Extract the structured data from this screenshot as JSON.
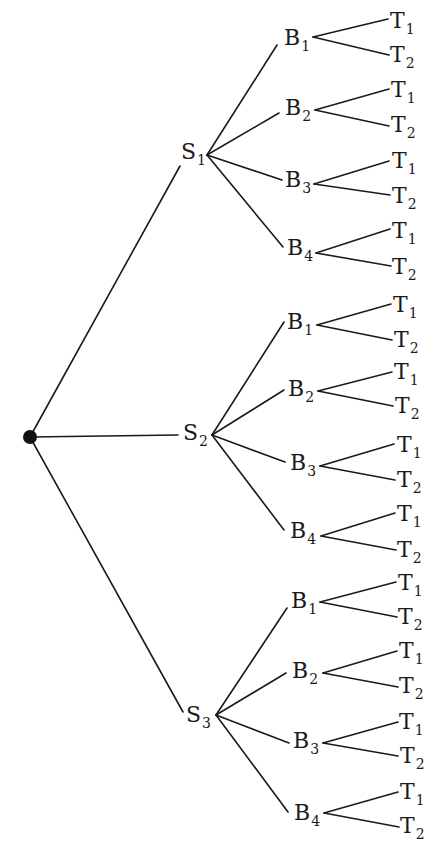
{
  "diagram": {
    "title": "",
    "type": "tree",
    "root": {
      "x": 30,
      "y": 437,
      "r": 7
    },
    "stage_nodes": [
      {
        "label": "S",
        "sub": "1",
        "label_pos": {
          "x": 181,
          "y": 141
        },
        "in_end": {
          "x": 180,
          "y": 166
        },
        "out_start": {
          "x": 207,
          "y": 155
        },
        "children": [
          {
            "label": "B",
            "sub": "1",
            "label_pos": {
              "x": 284,
              "y": 27
            },
            "in_end": {
              "x": 277,
              "y": 45
            },
            "out_start": {
              "x": 313,
              "y": 37
            },
            "leaves": [
              {
                "label": "T",
                "sub": "1",
                "label_pos": {
                  "x": 390,
                  "y": 10
                },
                "in_end": {
                  "x": 388,
                  "y": 19
                }
              },
              {
                "label": "T",
                "sub": "2",
                "label_pos": {
                  "x": 390,
                  "y": 44
                },
                "in_end": {
                  "x": 389,
                  "y": 55
                }
              }
            ]
          },
          {
            "label": "B",
            "sub": "2",
            "label_pos": {
              "x": 285,
              "y": 97
            },
            "in_end": {
              "x": 279,
              "y": 113
            },
            "out_start": {
              "x": 315,
              "y": 110
            },
            "leaves": [
              {
                "label": "T",
                "sub": "1",
                "label_pos": {
                  "x": 391,
                  "y": 79
                },
                "in_end": {
                  "x": 389,
                  "y": 89
                }
              },
              {
                "label": "T",
                "sub": "2",
                "label_pos": {
                  "x": 391,
                  "y": 114
                },
                "in_end": {
                  "x": 389,
                  "y": 126
                }
              }
            ]
          },
          {
            "label": "B",
            "sub": "3",
            "label_pos": {
              "x": 285,
              "y": 169
            },
            "in_end": {
              "x": 282,
              "y": 180
            },
            "out_start": {
              "x": 314,
              "y": 184
            },
            "leaves": [
              {
                "label": "T",
                "sub": "1",
                "label_pos": {
                  "x": 392,
                  "y": 150
                },
                "in_end": {
                  "x": 389,
                  "y": 161
                }
              },
              {
                "label": "T",
                "sub": "2",
                "label_pos": {
                  "x": 392,
                  "y": 185
                },
                "in_end": {
                  "x": 390,
                  "y": 195
                }
              }
            ]
          },
          {
            "label": "B",
            "sub": "4",
            "label_pos": {
              "x": 287,
              "y": 237
            },
            "in_end": {
              "x": 283,
              "y": 247
            },
            "out_start": {
              "x": 316,
              "y": 253
            },
            "leaves": [
              {
                "label": "T",
                "sub": "1",
                "label_pos": {
                  "x": 392,
                  "y": 220
                },
                "in_end": {
                  "x": 390,
                  "y": 229
                }
              },
              {
                "label": "T",
                "sub": "2",
                "label_pos": {
                  "x": 392,
                  "y": 256
                },
                "in_end": {
                  "x": 391,
                  "y": 266
                }
              }
            ]
          }
        ]
      },
      {
        "label": "S",
        "sub": "2",
        "label_pos": {
          "x": 183,
          "y": 422
        },
        "in_end": {
          "x": 178,
          "y": 435
        },
        "out_start": {
          "x": 212,
          "y": 435
        },
        "children": [
          {
            "label": "B",
            "sub": "1",
            "label_pos": {
              "x": 287,
              "y": 311
            },
            "in_end": {
              "x": 284,
              "y": 322
            },
            "out_start": {
              "x": 317,
              "y": 325
            },
            "leaves": [
              {
                "label": "T",
                "sub": "1",
                "label_pos": {
                  "x": 393,
                  "y": 294
                },
                "in_end": {
                  "x": 391,
                  "y": 304
                }
              },
              {
                "label": "T",
                "sub": "2",
                "label_pos": {
                  "x": 394,
                  "y": 329
                },
                "in_end": {
                  "x": 392,
                  "y": 340
                }
              }
            ]
          },
          {
            "label": "B",
            "sub": "2",
            "label_pos": {
              "x": 288,
              "y": 378
            },
            "in_end": {
              "x": 284,
              "y": 390
            },
            "out_start": {
              "x": 318,
              "y": 391
            },
            "leaves": [
              {
                "label": "T",
                "sub": "1",
                "label_pos": {
                  "x": 394,
                  "y": 361
                },
                "in_end": {
                  "x": 392,
                  "y": 372
                }
              },
              {
                "label": "T",
                "sub": "2",
                "label_pos": {
                  "x": 395,
                  "y": 395
                },
                "in_end": {
                  "x": 393,
                  "y": 406
                }
              }
            ]
          },
          {
            "label": "B",
            "sub": "3",
            "label_pos": {
              "x": 290,
              "y": 452
            },
            "in_end": {
              "x": 285,
              "y": 462
            },
            "out_start": {
              "x": 320,
              "y": 466
            },
            "leaves": [
              {
                "label": "T",
                "sub": "1",
                "label_pos": {
                  "x": 397,
                  "y": 434
                },
                "in_end": {
                  "x": 394,
                  "y": 444
                }
              },
              {
                "label": "T",
                "sub": "2",
                "label_pos": {
                  "x": 397,
                  "y": 469
                },
                "in_end": {
                  "x": 395,
                  "y": 480
                }
              }
            ]
          },
          {
            "label": "B",
            "sub": "4",
            "label_pos": {
              "x": 290,
              "y": 520
            },
            "in_end": {
              "x": 284,
              "y": 530
            },
            "out_start": {
              "x": 321,
              "y": 536
            },
            "leaves": [
              {
                "label": "T",
                "sub": "1",
                "label_pos": {
                  "x": 397,
                  "y": 503
                },
                "in_end": {
                  "x": 395,
                  "y": 513
                }
              },
              {
                "label": "T",
                "sub": "2",
                "label_pos": {
                  "x": 397,
                  "y": 539
                },
                "in_end": {
                  "x": 396,
                  "y": 550
                }
              }
            ]
          }
        ]
      },
      {
        "label": "S",
        "sub": "3",
        "label_pos": {
          "x": 186,
          "y": 704
        },
        "in_end": {
          "x": 183,
          "y": 712
        },
        "out_start": {
          "x": 216,
          "y": 715
        },
        "children": [
          {
            "label": "B",
            "sub": "1",
            "label_pos": {
              "x": 291,
              "y": 590
            },
            "in_end": {
              "x": 287,
              "y": 608
            },
            "out_start": {
              "x": 320,
              "y": 602
            },
            "leaves": [
              {
                "label": "T",
                "sub": "1",
                "label_pos": {
                  "x": 398,
                  "y": 572
                },
                "in_end": {
                  "x": 396,
                  "y": 582
                }
              },
              {
                "label": "T",
                "sub": "2",
                "label_pos": {
                  "x": 398,
                  "y": 606
                },
                "in_end": {
                  "x": 397,
                  "y": 617
                }
              }
            ]
          },
          {
            "label": "B",
            "sub": "2",
            "label_pos": {
              "x": 292,
              "y": 660
            },
            "in_end": {
              "x": 286,
              "y": 673
            },
            "out_start": {
              "x": 323,
              "y": 673
            },
            "leaves": [
              {
                "label": "T",
                "sub": "1",
                "label_pos": {
                  "x": 399,
                  "y": 640
                },
                "in_end": {
                  "x": 397,
                  "y": 651
                }
              },
              {
                "label": "T",
                "sub": "2",
                "label_pos": {
                  "x": 399,
                  "y": 675
                },
                "in_end": {
                  "x": 398,
                  "y": 687
                }
              }
            ]
          },
          {
            "label": "B",
            "sub": "3",
            "label_pos": {
              "x": 293,
              "y": 730
            },
            "in_end": {
              "x": 289,
              "y": 743
            },
            "out_start": {
              "x": 323,
              "y": 743
            },
            "leaves": [
              {
                "label": "T",
                "sub": "1",
                "label_pos": {
                  "x": 399,
                  "y": 711
                },
                "in_end": {
                  "x": 398,
                  "y": 722
                }
              },
              {
                "label": "T",
                "sub": "2",
                "label_pos": {
                  "x": 400,
                  "y": 745
                },
                "in_end": {
                  "x": 398,
                  "y": 756
                }
              }
            ]
          },
          {
            "label": "B",
            "sub": "4",
            "label_pos": {
              "x": 294,
              "y": 802
            },
            "in_end": {
              "x": 288,
              "y": 812
            },
            "out_start": {
              "x": 324,
              "y": 813
            },
            "leaves": [
              {
                "label": "T",
                "sub": "1",
                "label_pos": {
                  "x": 400,
                  "y": 781
                },
                "in_end": {
                  "x": 398,
                  "y": 792
                }
              },
              {
                "label": "T",
                "sub": "2",
                "label_pos": {
                  "x": 400,
                  "y": 815
                },
                "in_end": {
                  "x": 399,
                  "y": 827
                }
              }
            ]
          }
        ]
      }
    ]
  },
  "colors": {
    "line": "#1a1a1a",
    "dot": "#111111",
    "background": "#ffffff"
  }
}
